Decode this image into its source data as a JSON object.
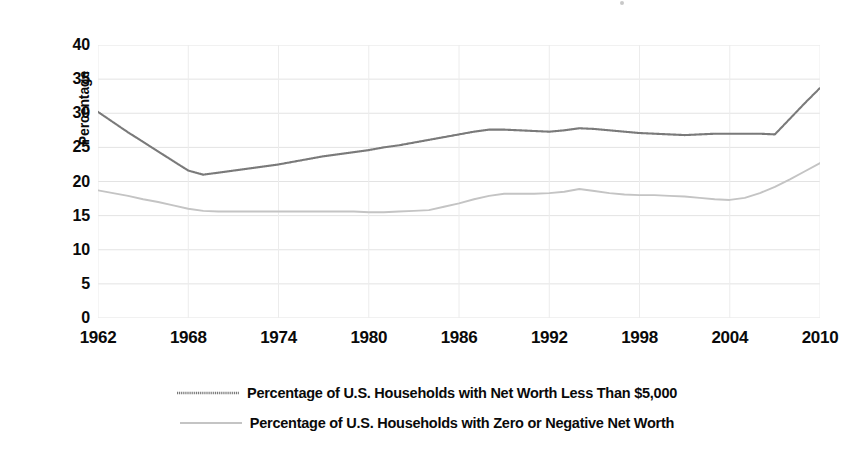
{
  "chart_data": {
    "type": "line",
    "title": "",
    "xlabel": "",
    "ylabel": "Percentage",
    "xlim": [
      1962,
      2010
    ],
    "ylim": [
      0,
      40
    ],
    "y_ticks": [
      40,
      35,
      30,
      25,
      20,
      15,
      10,
      5,
      0
    ],
    "x_ticks": [
      1962,
      1968,
      1974,
      1980,
      1986,
      1992,
      1998,
      2004,
      2010
    ],
    "grid": "both",
    "legend_position": "bottom",
    "x": [
      1962,
      1963,
      1964,
      1965,
      1966,
      1967,
      1968,
      1969,
      1970,
      1971,
      1972,
      1973,
      1974,
      1975,
      1976,
      1977,
      1978,
      1979,
      1980,
      1981,
      1982,
      1983,
      1984,
      1985,
      1986,
      1987,
      1988,
      1989,
      1990,
      1991,
      1992,
      1993,
      1994,
      1995,
      1996,
      1997,
      1998,
      1999,
      2000,
      2001,
      2002,
      2003,
      2004,
      2005,
      2006,
      2007,
      2008,
      2009,
      2010
    ],
    "series": [
      {
        "name": "Percentage of U.S. Households with Net Worth Less Than $5,000",
        "color": "#7a7a7a",
        "style": "fine-dotted",
        "values": [
          30.2,
          28.7,
          27.2,
          25.8,
          24.4,
          23.0,
          21.6,
          21.0,
          21.3,
          21.6,
          21.9,
          22.2,
          22.5,
          22.9,
          23.3,
          23.7,
          24.0,
          24.3,
          24.6,
          25.0,
          25.3,
          25.7,
          26.1,
          26.5,
          26.9,
          27.3,
          27.6,
          27.6,
          27.5,
          27.4,
          27.3,
          27.5,
          27.8,
          27.7,
          27.5,
          27.3,
          27.1,
          27.0,
          26.9,
          26.8,
          26.9,
          27.0,
          27.0,
          27.0,
          27.0,
          26.9,
          29.2,
          31.5,
          33.7
        ]
      },
      {
        "name": "Percentage of U.S. Households with Zero or Negative Net Worth",
        "color": "#c4c4c4",
        "style": "solid",
        "values": [
          18.7,
          18.3,
          17.9,
          17.4,
          17.0,
          16.5,
          16.0,
          15.7,
          15.6,
          15.6,
          15.6,
          15.6,
          15.6,
          15.6,
          15.6,
          15.6,
          15.6,
          15.6,
          15.5,
          15.5,
          15.6,
          15.7,
          15.8,
          16.3,
          16.8,
          17.4,
          17.9,
          18.2,
          18.2,
          18.2,
          18.3,
          18.5,
          18.9,
          18.6,
          18.3,
          18.1,
          18.0,
          18.0,
          17.9,
          17.8,
          17.6,
          17.4,
          17.3,
          17.6,
          18.3,
          19.2,
          20.3,
          21.5,
          22.7
        ]
      }
    ]
  },
  "axis": {
    "y_title": "Percentage"
  },
  "legend": {
    "items": [
      {
        "label": "Percentage of U.S. Households with Net Worth Less Than $5,000",
        "swatch": "dotted-line-swatch"
      },
      {
        "label": "Percentage of U.S. Households with Zero or Negative Net Worth",
        "swatch": "solid-line-swatch"
      }
    ]
  }
}
